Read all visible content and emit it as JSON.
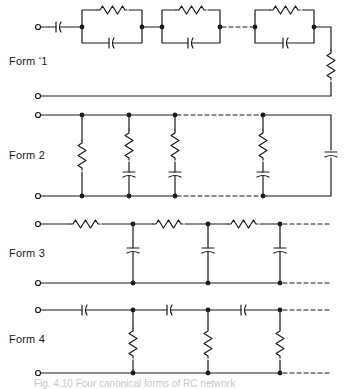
{
  "colors": {
    "ink": "#1a1a1a",
    "background": "#ffffff",
    "caption": "#c8c8c8"
  },
  "forms": [
    {
      "label": "Form ʻ1",
      "description": "Series capacitor, chain of parallel RC sections, terminating series resistor"
    },
    {
      "label": "Form 2",
      "description": "Shunt resistor, shunt series-RC branches, terminating shunt capacitor"
    },
    {
      "label": "Form 3",
      "description": "Ladder: series resistors, shunt capacitors (continues)"
    },
    {
      "label": "Form 4",
      "description": "Ladder: series capacitors, shunt resistors (continues)"
    }
  ],
  "caption": "Fig. 4.10  Four canonical forms of RC network"
}
